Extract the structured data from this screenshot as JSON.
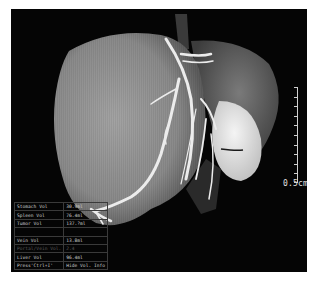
{
  "viewer": {
    "scale_bar": {
      "label": "0.5cm",
      "ticks": 10
    },
    "volume_info": {
      "rows": [
        {
          "label": "Stomach Vol",
          "value": "30.9ml",
          "dim": false
        },
        {
          "label": "Spleen Vol",
          "value": "76.4ml",
          "dim": false
        },
        {
          "label": "Tumor Vol",
          "value": "137.?ml",
          "dim": false
        },
        {
          "label": "",
          "value": "",
          "dim": true
        },
        {
          "label": "Vein Vol",
          "value": "13.8ml",
          "dim": false
        },
        {
          "label": "Portal/Vein Vol.",
          "value": "2.4",
          "dim": true
        },
        {
          "label": "Liver Vol",
          "value": "96.4ml",
          "dim": false
        },
        {
          "label": "Press'Ctrl+I'",
          "value": "Hide Vol. Info",
          "dim": false
        }
      ]
    },
    "colors": {
      "background": "#050505",
      "liver": "#8a8a8a",
      "tumor": "#e8e8e8",
      "vessel": "#f0f0f0",
      "text": "#cfcfcf"
    }
  }
}
